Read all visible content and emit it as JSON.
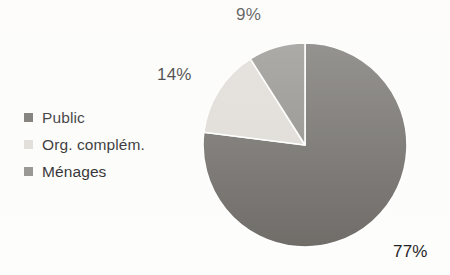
{
  "background_color": "#fdfdfb",
  "chart_data": {
    "type": "pie",
    "title": "",
    "subtitle": "",
    "xlabel": "",
    "ylabel": "",
    "grid": false,
    "legend_position": "left",
    "start_angle_deg": 0,
    "direction": "clockwise",
    "unit": "%",
    "categories": [
      "Public",
      "Org. complém.",
      "Ménages"
    ],
    "values": [
      77,
      14,
      9
    ],
    "colors": [
      "#6b6864",
      "#dedad5",
      "#8c8a86"
    ],
    "separator_color": "#ffffff",
    "data_labels": [
      "77%",
      "14%",
      "9%"
    ],
    "slices": [
      {
        "label": "Public",
        "value": 77,
        "display": "77%",
        "color": "#6b6864",
        "start_deg": 0,
        "end_deg": 277.2
      },
      {
        "label": "Org. complém.",
        "value": 14,
        "display": "14%",
        "color": "#dedad5",
        "start_deg": 277.2,
        "end_deg": 327.6
      },
      {
        "label": "Ménages",
        "value": 9,
        "display": "9%",
        "color": "#8c8a86",
        "start_deg": 327.6,
        "end_deg": 360
      }
    ]
  },
  "legend": {
    "items": [
      {
        "label": "Public",
        "color": "#6b6864"
      },
      {
        "label": "Org. complém.",
        "color": "#dedad5"
      },
      {
        "label": "Ménages",
        "color": "#8c8a86"
      }
    ]
  },
  "labels": {
    "menages": "9%",
    "org_complem": "14%",
    "public": "77%"
  }
}
